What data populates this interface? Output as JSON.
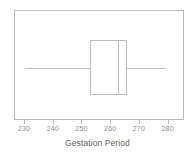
{
  "chart_data": {
    "type": "box",
    "title": "",
    "subtitle": "",
    "xlabel": "Gestation Period",
    "ylabel": "",
    "orientation": "horizontal",
    "grid": false,
    "legend": null,
    "xlim": [
      226.5,
      285
    ],
    "x_ticks": [
      230,
      240,
      250,
      260,
      270,
      280
    ],
    "x_tick_labels": [
      "230",
      "240",
      "250",
      "260",
      "270",
      "280"
    ],
    "series": [
      {
        "name": "Gestation Period",
        "whisker_low": 230,
        "q1": 252.5,
        "median": 262.5,
        "q3": 265.5,
        "whisker_high": 279,
        "outliers": []
      }
    ],
    "colors": {
      "box_edge": "#bdbdbd",
      "whisker": "#bdbdbd",
      "median": "#bdbdbd",
      "frame": "#b9b9b9",
      "tick_label": "#8a8a8a",
      "axis_title": "#5f5f5f",
      "background": "#ffffff"
    }
  },
  "axis": {
    "x_title": "Gestation Period",
    "ticks": [
      {
        "value": 230,
        "label": "230"
      },
      {
        "value": 240,
        "label": "240"
      },
      {
        "value": 250,
        "label": "250"
      },
      {
        "value": 260,
        "label": "260"
      },
      {
        "value": 270,
        "label": "270"
      },
      {
        "value": 280,
        "label": "280"
      }
    ]
  }
}
